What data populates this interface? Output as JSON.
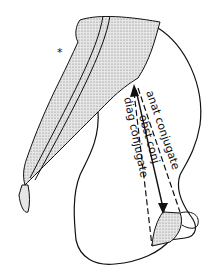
{
  "figure": {
    "labels": {
      "anat": "anat conjugate",
      "obst": "obst conj",
      "diag": "diag conjugate"
    },
    "marker": "*"
  },
  "colors": {
    "ink": "#111111",
    "stipple": "#bdbdbd",
    "background": "#ffffff"
  }
}
